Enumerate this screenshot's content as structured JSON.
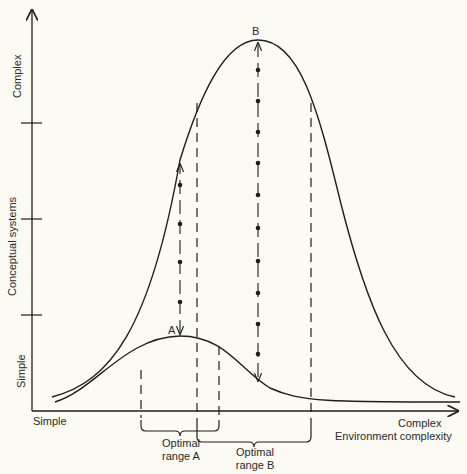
{
  "figure": {
    "y_axis": {
      "title": "Conceptual systems",
      "low_label": "Simple",
      "high_label": "Complex",
      "ticks": 3
    },
    "x_axis": {
      "title": "Environment complexity",
      "low_label": "Simple",
      "high_label": "Complex"
    },
    "curves": [
      {
        "id": "B",
        "label": "B",
        "description": "High, peaked curve (complex conceptual system)"
      },
      {
        "id": "A",
        "label": "A",
        "description": "Low, flat curve (simple conceptual system)"
      }
    ],
    "ranges": [
      {
        "id": "A",
        "line1": "Optimal",
        "line2": "range A"
      },
      {
        "id": "B",
        "line1": "Optimal",
        "line2": "range B"
      }
    ],
    "colors": {
      "background": "#fbfaf3",
      "ink": "#1e1e1e"
    }
  }
}
